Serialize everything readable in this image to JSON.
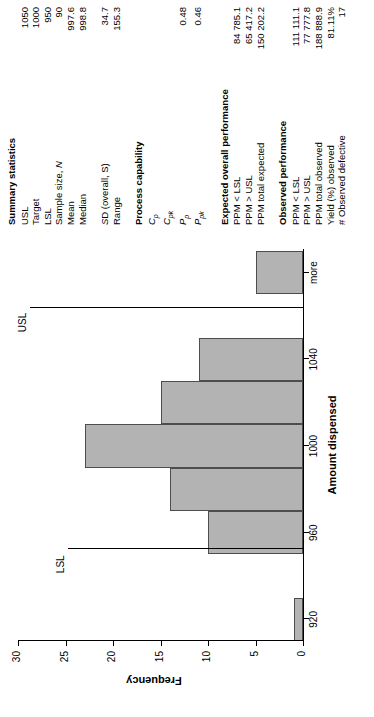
{
  "chart_data": {
    "type": "bar",
    "title": "",
    "xlabel": "Amount dispensed",
    "ylabel": "Frequency",
    "categories": [
      "920",
      "940",
      "960",
      "980",
      "1000",
      "1020",
      "1040",
      "1060",
      "more"
    ],
    "x_tick_labels": [
      "920",
      "960",
      "1000",
      "1040",
      "more"
    ],
    "y_tick_labels": [
      "0",
      "5",
      "10",
      "15",
      "20",
      "25",
      "30"
    ],
    "values": [
      1,
      0,
      10,
      14,
      23,
      15,
      11,
      0,
      5
    ],
    "ylim": [
      0,
      30
    ],
    "grid": false,
    "legend": "none",
    "annotations": [
      {
        "label": "LSL",
        "value": 950
      },
      {
        "label": "USL",
        "value": 1050
      }
    ]
  },
  "summary": {
    "title": "Summary statistics",
    "rows": [
      {
        "label": "USL",
        "value": "1050"
      },
      {
        "label": "Target",
        "value": "1000"
      },
      {
        "label": "LSL",
        "value": "950"
      },
      {
        "label": "Sample size, N",
        "value": "90"
      },
      {
        "label": "Mean",
        "value": "997.6"
      },
      {
        "label": "Median",
        "value": "998.8"
      }
    ],
    "rows2": [
      {
        "label": "SD (overall, S)",
        "value": "34.7"
      },
      {
        "label": "Range",
        "value": "155.3"
      }
    ]
  },
  "capability": {
    "title": "Process capability",
    "rows": [
      {
        "sym": "C",
        "sub": "p",
        "value": ""
      },
      {
        "sym": "C",
        "sub": "pk",
        "value": ""
      },
      {
        "sym": "P",
        "sub": "p",
        "value": "0.48"
      },
      {
        "sym": "P",
        "sub": "pk",
        "value": "0.46"
      }
    ]
  },
  "expected": {
    "title": "Expected overall performance",
    "rows": [
      {
        "label": "PPM < LSL",
        "value": "84 785.1"
      },
      {
        "label": "PPM > USL",
        "value": "65 417.2"
      },
      {
        "label": "PPM total expected",
        "value": "150 202.2"
      }
    ]
  },
  "observed": {
    "title": "Observed performance",
    "rows": [
      {
        "label": "PPM < LSL",
        "value": "111 111.1"
      },
      {
        "label": "PPM > USL",
        "value": "77 777.8"
      },
      {
        "label": "PPM total observed",
        "value": "188 888.9"
      },
      {
        "label": "Yield (%) observed",
        "value": "81.11%"
      },
      {
        "label": "# Observed defective",
        "value": "17"
      }
    ]
  },
  "colors": {
    "bar_fill": "#b3b3b3",
    "bar_stroke": "#4d4d4d",
    "axis": "#000000"
  }
}
